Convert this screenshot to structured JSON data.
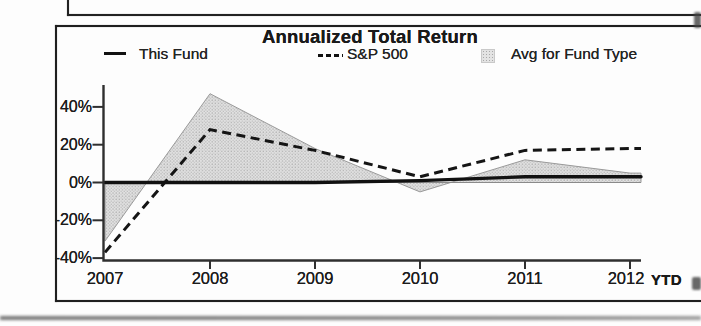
{
  "page": {
    "upper_box_note": "bottom edge of a cropped box above the chart panel",
    "panel": "chart-panel"
  },
  "chart_data": {
    "type": "line",
    "title": "Annualized Total Return",
    "categories": [
      "2007",
      "2008",
      "2009",
      "2010",
      "2011",
      "2012"
    ],
    "x_axis_suffix_label": "YTD",
    "series": [
      {
        "name": "This Fund",
        "style": "solid-line",
        "values": [
          0,
          0,
          0,
          1,
          3,
          3
        ]
      },
      {
        "name": "S&P 500",
        "style": "dashed-line",
        "values": [
          -37,
          28,
          17,
          3,
          17,
          18
        ]
      },
      {
        "name": "Avg for Fund Type",
        "style": "shaded-area",
        "values": [
          -31,
          47,
          18,
          -5,
          12,
          5
        ]
      }
    ],
    "ytick_labels": [
      "40%",
      "20%",
      "0%",
      "-20%",
      "-40%"
    ],
    "ytick_values": [
      40,
      20,
      0,
      -20,
      -40
    ],
    "ylim": [
      -42,
      52
    ],
    "grid": false,
    "legend_position": "top",
    "colors": {
      "line": "#111111",
      "dashed_line": "#151515",
      "area_fill": "#e2e2e2",
      "area_dots": "#b0b0b0",
      "area_border": "#9a9a9a",
      "axis": "#2f2f2f",
      "zero_line": "#8a8a8a"
    }
  }
}
